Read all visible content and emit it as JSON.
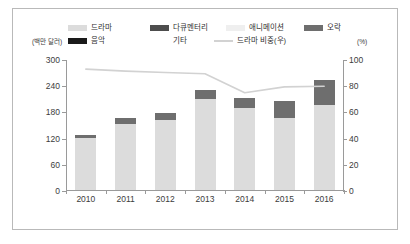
{
  "chart_data": {
    "type": "bar",
    "title": "",
    "subtitle": "",
    "xlabel": "",
    "ylabel": "(백만 달러)",
    "y2label": "(%)",
    "categories": [
      "2010",
      "2011",
      "2012",
      "2013",
      "2014",
      "2015",
      "2016"
    ],
    "ylim": [
      0,
      300
    ],
    "yticks": [
      0,
      60,
      120,
      180,
      240,
      300
    ],
    "y2lim": [
      0,
      100
    ],
    "y2ticks": [
      0,
      20,
      40,
      60,
      80,
      100
    ],
    "grid": false,
    "legend_position": "top",
    "stacked": true,
    "series": [
      {
        "name": "드라마",
        "axis": "left",
        "color": "#dcdcdc",
        "type": "bar",
        "values": [
          118,
          152,
          160,
          208,
          188,
          165,
          195
        ]
      },
      {
        "name": "음악",
        "axis": "left",
        "color": "#1a1a1a",
        "type": "bar",
        "values": [
          0,
          0,
          0,
          0,
          0,
          0,
          0
        ]
      },
      {
        "name": "다큐멘터리",
        "axis": "left",
        "color": "#4d4d4d",
        "type": "bar",
        "values": [
          0,
          0,
          0,
          0,
          0,
          0,
          0
        ]
      },
      {
        "name": "기타",
        "axis": "left",
        "color": "#a8a8a8",
        "type": "bar",
        "values": [
          0,
          0,
          0,
          0,
          0,
          0,
          0
        ]
      },
      {
        "name": "애니메이션",
        "axis": "left",
        "color": "#efefef",
        "type": "bar",
        "values": [
          0,
          0,
          0,
          0,
          0,
          0,
          0
        ]
      },
      {
        "name": "오락",
        "axis": "left",
        "color": "#6e6e6e",
        "type": "bar",
        "values": [
          7,
          14,
          17,
          21,
          22,
          39,
          57
        ]
      },
      {
        "name": "드라마 비중(우)",
        "axis": "right",
        "color": "#d2d2d2",
        "type": "line",
        "values": [
          93,
          91.5,
          90.5,
          89.5,
          75,
          79.5,
          80
        ]
      }
    ]
  },
  "legend": {
    "items": [
      {
        "label": "드라마",
        "color": "#dcdcdc",
        "marker": "swatch"
      },
      {
        "label": "다큐멘터리",
        "color": "#4d4d4d",
        "marker": "swatch"
      },
      {
        "label": "애니메이션",
        "color": "#efefef",
        "marker": "swatch"
      },
      {
        "label": "오락",
        "color": "#6e6e6e",
        "marker": "swatch"
      },
      {
        "label": "음악",
        "color": "#1a1a1a",
        "marker": "swatch"
      },
      {
        "label": "기타",
        "color": "#a8a8a8",
        "marker": "none"
      },
      {
        "label": "드라마 비중(우)",
        "color": "#d2d2d2",
        "marker": "line"
      }
    ]
  },
  "axes": {
    "left_unit": "(백만 달러)",
    "right_unit": "(%)",
    "left_ticks": [
      "300",
      "240",
      "180",
      "120",
      "60",
      "0"
    ],
    "right_ticks": [
      "100",
      "80",
      "60",
      "40",
      "20",
      "0"
    ],
    "x_ticks": [
      "2010",
      "2011",
      "2012",
      "2013",
      "2014",
      "2015",
      "2016"
    ]
  }
}
